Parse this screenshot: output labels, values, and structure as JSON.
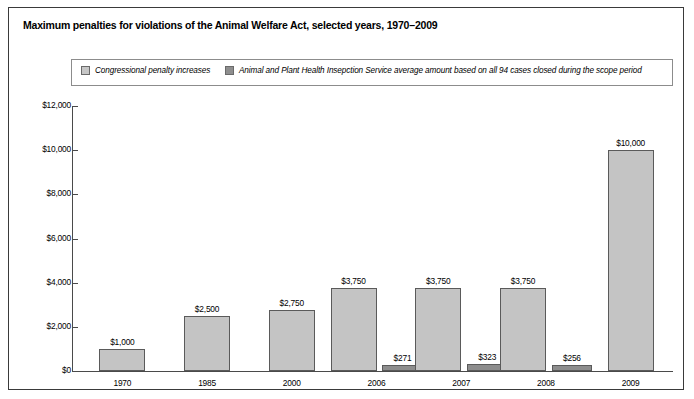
{
  "title": "Maximum penalties for violations of the Animal Welfare Act, selected years, 1970–2009",
  "legend": {
    "items": [
      {
        "label": "Congressional penalty increases",
        "color": "#c4c4c4"
      },
      {
        "label": "Animal and Plant Health Insepction Service average amount based on all 94 cases closed during the scope period",
        "color": "#8d8d8d"
      }
    ]
  },
  "chart_data": {
    "type": "bar",
    "title": "Maximum penalties for violations of the Animal Welfare Act, selected years, 1970–2009",
    "xlabel": "",
    "ylabel": "",
    "categories": [
      "1970",
      "1985",
      "2000",
      "2006",
      "2007",
      "2008",
      "2009"
    ],
    "ylim": [
      0,
      12000
    ],
    "yticks": [
      0,
      2000,
      4000,
      6000,
      8000,
      10000,
      12000
    ],
    "ytick_labels": [
      "$0",
      "$2,000",
      "$4,000",
      "$6,000",
      "$8,000",
      "$10,000",
      "$12,000"
    ],
    "grid": false,
    "legend_position": "top",
    "series": [
      {
        "name": "Congressional penalty increases",
        "color": "#c4c4c4",
        "values": [
          1000,
          2500,
          2750,
          3750,
          3750,
          3750,
          10000
        ],
        "value_labels": [
          "$1,000",
          "$2,500",
          "$2,750",
          "$3,750",
          "$3,750",
          "$3,750",
          "$10,000"
        ]
      },
      {
        "name": "Animal and Plant Health Insepction Service average amount based on all 94 cases closed during the scope period",
        "color": "#8d8d8d",
        "values": [
          null,
          null,
          null,
          271,
          323,
          256,
          null
        ],
        "value_labels": [
          "",
          "",
          "",
          "$271",
          "$323",
          "$256",
          ""
        ]
      }
    ]
  }
}
